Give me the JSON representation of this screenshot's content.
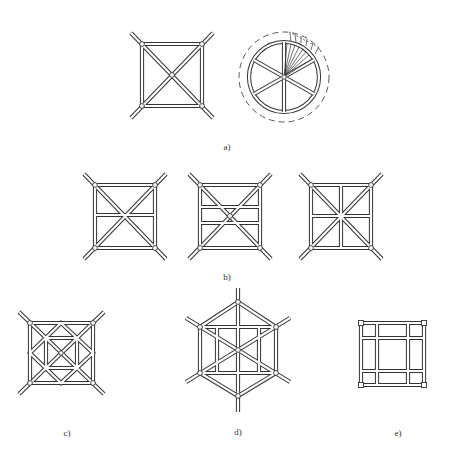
{
  "figure": {
    "panels": [
      {
        "id": "a",
        "label": "a)",
        "items": [
          "square frame with diagonal cross bracing",
          "circular frame with six spokes and radial fan"
        ]
      },
      {
        "id": "b",
        "label": "b)",
        "items": [
          "square with X brace and one horizontal bar",
          "square with X brace and two horizontal bars",
          "square with X brace and cross bars"
        ]
      },
      {
        "id": "c",
        "label": "c)",
        "items": [
          "square with nested diamond and inner square"
        ]
      },
      {
        "id": "d",
        "label": "d)",
        "items": [
          "hexagon with diagonal braces and two vertical bars"
        ]
      },
      {
        "id": "e",
        "label": "e)",
        "items": [
          "square grid with two horizontal and two vertical bars"
        ]
      }
    ]
  },
  "labels": {
    "a": "a)",
    "b": "b)",
    "c": "c)",
    "d": "d)",
    "e": "e)"
  },
  "colors": {
    "line": "#333333",
    "background": "#ffffff"
  }
}
